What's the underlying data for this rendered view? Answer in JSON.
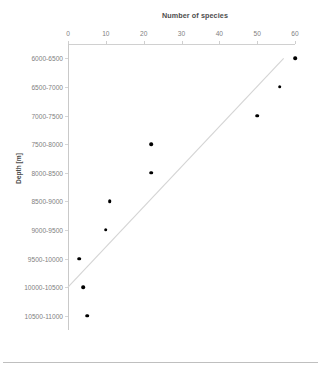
{
  "chart_data": {
    "type": "scatter",
    "title": "Number of species",
    "xlabel": "Number of species",
    "ylabel": "Depth [m]",
    "xlim": [
      0,
      60
    ],
    "x_ticks": [
      0,
      10,
      20,
      30,
      40,
      50,
      60
    ],
    "x_tick_labels": [
      "0",
      "10",
      "20",
      "30",
      "40",
      "50",
      "60"
    ],
    "categories": [
      "6000-6500",
      "6500-7000",
      "7000-7500",
      "7500-8000",
      "8000-8500",
      "8500-9000",
      "9000-9500",
      "9500-10000",
      "10000-10500",
      "10500-11000"
    ],
    "values": [
      60,
      56,
      50,
      22,
      22,
      11,
      10,
      3,
      4,
      5
    ],
    "points": [
      {
        "category": "6000-6500",
        "species": 60
      },
      {
        "category": "6500-7000",
        "species": 56
      },
      {
        "category": "7000-7500",
        "species": 50
      },
      {
        "category": "7500-8000",
        "species": 22
      },
      {
        "category": "8000-8500",
        "species": 22
      },
      {
        "category": "8500-9000",
        "species": 11
      },
      {
        "category": "9000-9500",
        "species": 10
      },
      {
        "category": "9500-10000",
        "species": 3
      },
      {
        "category": "10000-10500",
        "species": 4
      },
      {
        "category": "10500-11000",
        "species": 5
      }
    ],
    "trendline": {
      "type": "linear",
      "start": {
        "species": 0,
        "category": "10000-10500"
      },
      "end": {
        "species": 57,
        "category": "6000-6500"
      }
    },
    "grid": false,
    "legend": "none",
    "x_axis_position": "top",
    "y_axis_direction": "top-to-bottom",
    "marker_color": "#000000",
    "trendline_color": "#d4d4d4",
    "axis_color": "#cfcfcf",
    "text_color": "#7f7f7f"
  }
}
